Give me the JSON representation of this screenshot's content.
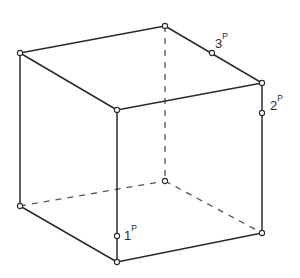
{
  "figure": {
    "background_color": "#ffffff",
    "line_color": "#2b2b2b",
    "hidden_line_color": "#555555",
    "line_width": 1.5,
    "hidden_line_width": 1.3,
    "hidden_dash_pattern": "6 6",
    "vertex_marker_radius": 2.6,
    "vertex_marker_fill": "#ffffff"
  },
  "vertices": {
    "top_left_back": {
      "id": "A",
      "x": 20,
      "y": 53
    },
    "top_back_apex": {
      "id": "B",
      "x": 165,
      "y": 26
    },
    "top_right_back": {
      "id": "C",
      "x": 262,
      "y": 83
    },
    "top_front": {
      "id": "D",
      "x": 117,
      "y": 110
    },
    "bottom_left": {
      "id": "E",
      "x": 20,
      "y": 206
    },
    "bottom_back": {
      "id": "F",
      "x": 165,
      "y": 181
    },
    "bottom_right": {
      "id": "G",
      "x": 262,
      "y": 233
    },
    "bottom_front": {
      "id": "H",
      "x": 117,
      "y": 262
    }
  },
  "edges_solid": [
    {
      "name": "top-left-rear-edge",
      "from": "A",
      "to": "B",
      "x1": 20,
      "y1": 53,
      "x2": 165,
      "y2": 26
    },
    {
      "name": "top-right-rear-edge",
      "from": "B",
      "to": "C",
      "x1": 165,
      "y1": 26,
      "x2": 262,
      "y2": 83
    },
    {
      "name": "top-left-front-edge",
      "from": "A",
      "to": "D",
      "x1": 20,
      "y1": 53,
      "x2": 117,
      "y2": 110
    },
    {
      "name": "top-right-front-edge",
      "from": "D",
      "to": "C",
      "x1": 117,
      "y1": 110,
      "x2": 262,
      "y2": 83
    },
    {
      "name": "vertical-left-edge",
      "from": "A",
      "to": "E",
      "x1": 20,
      "y1": 53,
      "x2": 20,
      "y2": 206
    },
    {
      "name": "vertical-front-edge",
      "from": "D",
      "to": "H",
      "x1": 117,
      "y1": 110,
      "x2": 117,
      "y2": 262
    },
    {
      "name": "vertical-right-edge",
      "from": "C",
      "to": "G",
      "x1": 262,
      "y1": 83,
      "x2": 262,
      "y2": 233
    },
    {
      "name": "bottom-left-front-edge",
      "from": "E",
      "to": "H",
      "x1": 20,
      "y1": 206,
      "x2": 117,
      "y2": 262
    },
    {
      "name": "bottom-right-front-edge",
      "from": "H",
      "to": "G",
      "x1": 117,
      "y1": 262,
      "x2": 262,
      "y2": 233
    }
  ],
  "edges_hidden": [
    {
      "name": "vertical-rear-hidden-edge",
      "from": "B",
      "to": "F",
      "x1": 165,
      "y1": 26,
      "x2": 165,
      "y2": 181
    },
    {
      "name": "bottom-left-rear-hidden-edge",
      "from": "E",
      "to": "F",
      "x1": 20,
      "y1": 206,
      "x2": 165,
      "y2": 181
    },
    {
      "name": "bottom-right-rear-hidden-edge",
      "from": "F",
      "to": "G",
      "x1": 165,
      "y1": 181,
      "x2": 262,
      "y2": 233
    }
  ],
  "labeled_points": [
    {
      "name": "point-1",
      "number": "1",
      "superscript": "P",
      "marker": {
        "x": 117,
        "y": 236,
        "r": 2.6
      },
      "label": {
        "x": 124,
        "y": 240
      },
      "on_edge": "vertical-front-edge"
    },
    {
      "name": "point-2",
      "number": "2",
      "superscript": "P",
      "marker": {
        "x": 262,
        "y": 113,
        "r": 2.6
      },
      "label": {
        "x": 270,
        "y": 110
      },
      "on_edge": "vertical-right-edge"
    },
    {
      "name": "point-3",
      "number": "3",
      "superscript": "P",
      "marker": {
        "x": 212,
        "y": 53,
        "r": 2.6
      },
      "label": {
        "x": 215,
        "y": 48
      },
      "on_edge": "top-right-rear-edge"
    }
  ]
}
